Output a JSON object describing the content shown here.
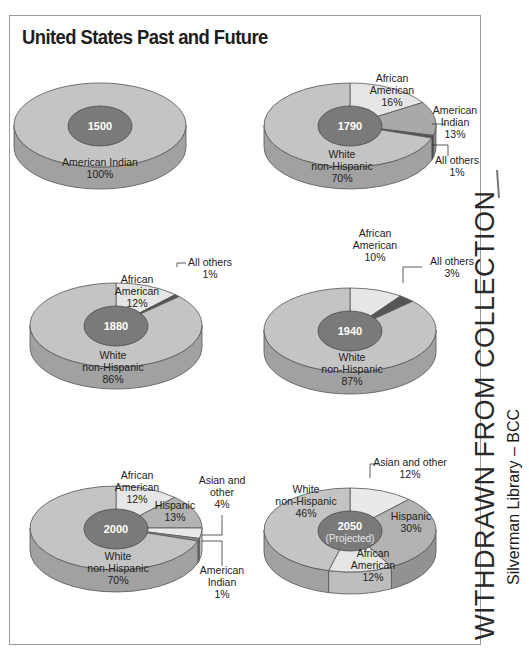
{
  "title": "United States Past and Future",
  "stamp": {
    "line1": "WITHDRAWN FROM COLLECTION",
    "line2": "Silverman Library – BCC"
  },
  "colors": {
    "white_non_hispanic": "#c4c4c4",
    "african_american": "#e6e6e6",
    "american_indian": "#a9a9a9",
    "hispanic": "#b2b2b2",
    "asian_other": "#e9e9e9",
    "all_others": "#555555",
    "center": "#7a7a7a",
    "side": "#a6a6a6",
    "outline": "#555555"
  },
  "pies": [
    {
      "year": "1500",
      "subtitle": "",
      "cx": 100,
      "cy": 125,
      "slices": [
        {
          "name": "American Indian",
          "value": 100,
          "color": "#c4c4c4"
        }
      ],
      "labels": [
        {
          "lines": [
            "American Indian",
            "100%"
          ],
          "x": 100,
          "y": 166
        }
      ]
    },
    {
      "year": "1790",
      "subtitle": "",
      "cx": 350,
      "cy": 125,
      "slices": [
        {
          "name": "African American",
          "value": 16,
          "color": "#e6e6e6"
        },
        {
          "name": "American Indian",
          "value": 13,
          "color": "#a9a9a9"
        },
        {
          "name": "All others",
          "value": 1,
          "color": "#555555"
        },
        {
          "name": "White non-Hispanic",
          "value": 70,
          "color": "#c4c4c4"
        }
      ],
      "labels": [
        {
          "lines": [
            "African",
            "American",
            "16%"
          ],
          "x": 392,
          "y": 82
        },
        {
          "lines": [
            "American",
            "Indian",
            "13%"
          ],
          "x": 455,
          "y": 114
        },
        {
          "lines": [
            "All others",
            "1%"
          ],
          "x": 457,
          "y": 164
        },
        {
          "lines": [
            "White",
            "non-Hispanic",
            "70%"
          ],
          "x": 342,
          "y": 158
        }
      ]
    },
    {
      "year": "1880",
      "subtitle": "",
      "cx": 116,
      "cy": 325,
      "slices": [
        {
          "name": "African American",
          "value": 12,
          "color": "#e6e6e6"
        },
        {
          "name": "All others",
          "value": 1,
          "color": "#555555"
        },
        {
          "name": "White non-Hispanic",
          "value": 86,
          "color": "#c4c4c4"
        }
      ],
      "labels": [
        {
          "lines": [
            "African",
            "American",
            "12%"
          ],
          "x": 137,
          "y": 283
        },
        {
          "lines": [
            "All others",
            "1%"
          ],
          "x": 210,
          "y": 266
        },
        {
          "lines": [
            "White",
            "non-Hispanic",
            "86%"
          ],
          "x": 113,
          "y": 359
        }
      ]
    },
    {
      "year": "1940",
      "subtitle": "",
      "cx": 350,
      "cy": 330,
      "slices": [
        {
          "name": "African American",
          "value": 10,
          "color": "#e6e6e6"
        },
        {
          "name": "All others",
          "value": 3,
          "color": "#555555"
        },
        {
          "name": "White non-Hispanic",
          "value": 87,
          "color": "#c4c4c4"
        }
      ],
      "labels": [
        {
          "lines": [
            "African",
            "American",
            "10%"
          ],
          "x": 375,
          "y": 237
        },
        {
          "lines": [
            "All others",
            "3%"
          ],
          "x": 452,
          "y": 265
        },
        {
          "lines": [
            "White",
            "non-Hispanic",
            "87%"
          ],
          "x": 352,
          "y": 361
        }
      ]
    },
    {
      "year": "2000",
      "subtitle": "",
      "cx": 116,
      "cy": 528,
      "slices": [
        {
          "name": "African American",
          "value": 12,
          "color": "#e6e6e6"
        },
        {
          "name": "Hispanic",
          "value": 13,
          "color": "#b2b2b2"
        },
        {
          "name": "Asian and other",
          "value": 4,
          "color": "#e9e9e9"
        },
        {
          "name": "American Indian",
          "value": 1,
          "color": "#8f8f8f"
        },
        {
          "name": "White non-Hispanic",
          "value": 70,
          "color": "#c4c4c4"
        }
      ],
      "labels": [
        {
          "lines": [
            "African",
            "American",
            "12%"
          ],
          "x": 137,
          "y": 479
        },
        {
          "lines": [
            "Hispanic",
            "13%"
          ],
          "x": 175,
          "y": 509
        },
        {
          "lines": [
            "Asian and",
            "other",
            "4%"
          ],
          "x": 222,
          "y": 484
        },
        {
          "lines": [
            "American",
            "Indian",
            "1%"
          ],
          "x": 222,
          "y": 574
        },
        {
          "lines": [
            "White",
            "non-Hispanic",
            "70%"
          ],
          "x": 118,
          "y": 560
        }
      ]
    },
    {
      "year": "2050",
      "subtitle": "(Projected)",
      "cx": 350,
      "cy": 530,
      "slices": [
        {
          "name": "Asian and other",
          "value": 12,
          "color": "#e9e9e9"
        },
        {
          "name": "Hispanic",
          "value": 30,
          "color": "#b2b2b2"
        },
        {
          "name": "African American",
          "value": 12,
          "color": "#e6e6e6"
        },
        {
          "name": "White non-Hispanic",
          "value": 46,
          "color": "#c4c4c4"
        }
      ],
      "labels": [
        {
          "lines": [
            "Asian and other",
            "12%"
          ],
          "x": 410,
          "y": 466
        },
        {
          "lines": [
            "Hispanic",
            "30%"
          ],
          "x": 411,
          "y": 520
        },
        {
          "lines": [
            "African",
            "American",
            "12%"
          ],
          "x": 373,
          "y": 557
        },
        {
          "lines": [
            "White",
            "non-Hispanic",
            "46%"
          ],
          "x": 306,
          "y": 493
        }
      ]
    }
  ],
  "chart_data": [
    {
      "type": "pie",
      "title": "1500",
      "categories": [
        "American Indian"
      ],
      "values": [
        100
      ]
    },
    {
      "type": "pie",
      "title": "1790",
      "categories": [
        "African American",
        "American Indian",
        "All others",
        "White non-Hispanic"
      ],
      "values": [
        16,
        13,
        1,
        70
      ]
    },
    {
      "type": "pie",
      "title": "1880",
      "categories": [
        "African American",
        "All others",
        "White non-Hispanic"
      ],
      "values": [
        12,
        1,
        86
      ]
    },
    {
      "type": "pie",
      "title": "1940",
      "categories": [
        "African American",
        "All others",
        "White non-Hispanic"
      ],
      "values": [
        10,
        3,
        87
      ]
    },
    {
      "type": "pie",
      "title": "2000",
      "categories": [
        "African American",
        "Hispanic",
        "Asian and other",
        "American Indian",
        "White non-Hispanic"
      ],
      "values": [
        12,
        13,
        4,
        1,
        70
      ]
    },
    {
      "type": "pie",
      "title": "2050 (Projected)",
      "categories": [
        "Asian and other",
        "Hispanic",
        "African American",
        "White non-Hispanic"
      ],
      "values": [
        12,
        30,
        12,
        46
      ]
    }
  ]
}
